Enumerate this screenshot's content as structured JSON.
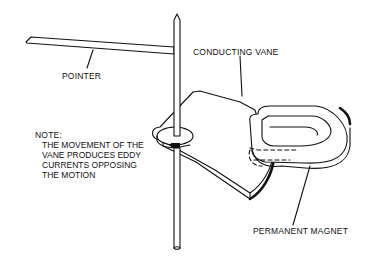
{
  "diagram": {
    "labels": {
      "pointer": "POINTER",
      "conducting_vane": "CONDUCTING VANE",
      "permanent_magnet": "PERMANENT MAGNET"
    },
    "note": {
      "heading": "NOTE:",
      "lines": [
        "THE MOVEMENT OF THE",
        "VANE PRODUCES EDDY",
        "CURRENTS OPPOSING",
        "THE MOTION"
      ]
    },
    "colors": {
      "ink": "#111111",
      "background": "#ffffff"
    }
  }
}
